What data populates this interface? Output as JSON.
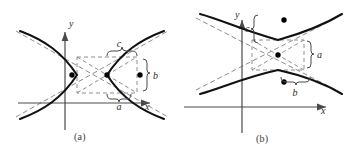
{
  "figure": {
    "width": 347,
    "height": 152,
    "background": "#ffffff",
    "curve_color": "#111111",
    "axis_color": "#4a4a4a",
    "dashed_color": "#8a8a8a",
    "dot_color": "#000000"
  },
  "panels": [
    {
      "id": "a",
      "caption": "(a)",
      "orientation": "horizontal-transverse-axis",
      "axes": {
        "x_label": "x",
        "y_label": "y",
        "x_axis_y": 103,
        "y_axis_x": 65
      },
      "labels": [
        {
          "name": "a",
          "text": "a",
          "brace": "under",
          "meaning": "semi-transverse-axis"
        },
        {
          "name": "b",
          "text": "b",
          "brace": "left",
          "meaning": "semi-conjugate-axis"
        },
        {
          "name": "c",
          "text": "c",
          "brace": "under",
          "meaning": "focal-distance"
        }
      ],
      "points": [
        {
          "name": "left-focus",
          "x": 72,
          "y": 75
        },
        {
          "name": "center",
          "x": 107,
          "y": 75
        },
        {
          "name": "right-focus",
          "x": 140,
          "y": 75
        }
      ],
      "box": {
        "x1": 77,
        "y1": 57,
        "x2": 137,
        "y2": 93
      }
    },
    {
      "id": "b",
      "caption": "(b)",
      "orientation": "vertical-transverse-axis",
      "axes": {
        "x_label": "x",
        "y_label": "y",
        "x_axis_y": 107,
        "y_axis_x": 68
      },
      "labels": [
        {
          "name": "a",
          "text": "a",
          "brace": "right",
          "meaning": "semi-transverse-axis"
        },
        {
          "name": "b",
          "text": "b",
          "brace": "under",
          "meaning": "semi-conjugate-axis"
        },
        {
          "name": "c",
          "text": "c",
          "brace": "right",
          "meaning": "focal-distance"
        }
      ],
      "points": [
        {
          "name": "upper-focus",
          "x": 110,
          "y": 20
        },
        {
          "name": "center",
          "x": 110,
          "y": 54
        },
        {
          "name": "lower-focus",
          "x": 110,
          "y": 82
        }
      ],
      "box": {
        "x1": 78,
        "y1": 40,
        "x2": 130,
        "y2": 70
      }
    }
  ],
  "axis_labels": {
    "x": "x",
    "y": "y"
  },
  "letters": {
    "a": "a",
    "b": "b",
    "c": "c"
  },
  "braces": {
    "left_curly": "{",
    "right_curly": "}",
    "under_brace": "⏟",
    "over_brace": "⏞"
  }
}
